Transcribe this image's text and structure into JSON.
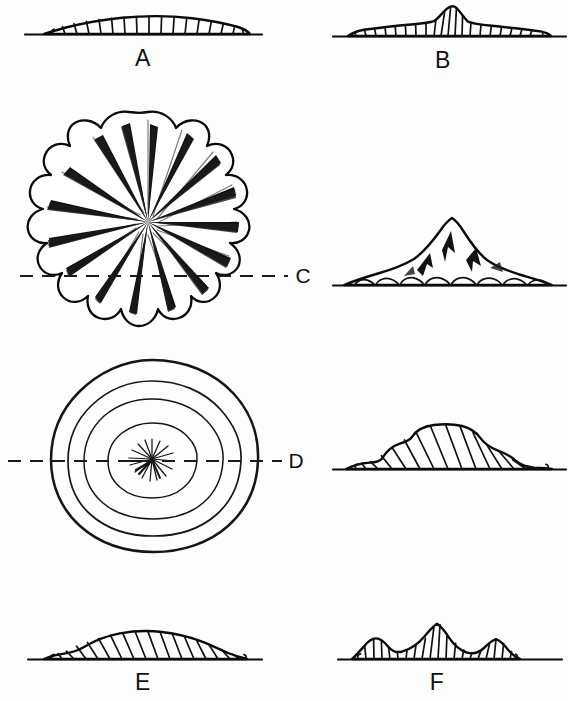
{
  "figure": {
    "background_color": "#fdfdfd",
    "ink_color": "#0b0b0b"
  },
  "panels": [
    {
      "id": "A",
      "label": "A",
      "label_position": "below",
      "view": "cross-section",
      "description": "Low broad symmetrical mound, gently convex, uniform hatching",
      "peaks": 1,
      "relative_height": 0.22,
      "relative_width": 1.0,
      "hatch_count": 17
    },
    {
      "id": "B",
      "label": "B",
      "label_position": "below",
      "view": "cross-section",
      "description": "Low flat platform with a single sharp central peak",
      "peaks": 1,
      "relative_height": 0.42,
      "relative_width": 1.0,
      "hatch_count": 20
    },
    {
      "id": "C",
      "label": "C",
      "label_position": "center-right",
      "view": "plan-and-cross-section",
      "plan_description": "Scalloped rosette with radiating shaded ridges running from a central point to each lobe",
      "lobes": 15,
      "section_description": "Tall steep conical summit rising from a broad low apron with lobed foot",
      "peaks": 1,
      "relative_height": 0.78,
      "section_line": "dashed horizontal"
    },
    {
      "id": "D",
      "label": "D",
      "label_position": "center-right",
      "view": "plan-and-cross-section",
      "plan_description": "Concentric irregular rings with a small radiating starburst at the centre",
      "rings": 4,
      "section_description": "Flat-topped dome with stepped shoulders and hatched flanks",
      "peaks": 1,
      "relative_height": 0.46,
      "section_line": "dashed horizontal"
    },
    {
      "id": "E",
      "label": "E",
      "label_position": "below",
      "view": "cross-section",
      "description": "Low asymmetric mound, slightly higher left of centre, uniform hatching",
      "peaks": 1,
      "relative_height": 0.26,
      "relative_width": 1.0,
      "hatch_count": 18
    },
    {
      "id": "F",
      "label": "F",
      "label_position": "below",
      "view": "cross-section",
      "description": "Triple-crested profile with the tallest peak at centre and lower peaks flanking it",
      "peaks": 3,
      "relative_height": 0.4,
      "relative_width": 0.85,
      "hatch_count": 16
    }
  ],
  "labels": {
    "a": "A",
    "b": "B",
    "c": "C",
    "d": "D",
    "e": "E",
    "f": "F"
  }
}
